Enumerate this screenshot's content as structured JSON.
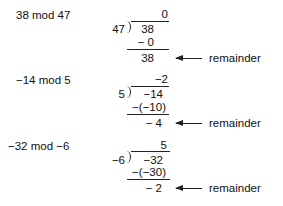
{
  "examples": [
    {
      "expression": "38 mod 47",
      "divisor": "47",
      "quotient": "0",
      "dividend": "38",
      "subtract": "− 0",
      "remainder_value": "38",
      "remainder_label": "remainder"
    },
    {
      "expression": "−14 mod 5",
      "divisor": "5",
      "quotient": "−2",
      "dividend": "−14",
      "subtract": "−(−10)",
      "remainder_value": "− 4",
      "remainder_label": "remainder"
    },
    {
      "expression": "−32 mod −6",
      "divisor": "−6",
      "quotient": "5",
      "dividend": "−32",
      "subtract": "−(−30)",
      "remainder_value": "− 2",
      "remainder_label": "remainder"
    }
  ]
}
